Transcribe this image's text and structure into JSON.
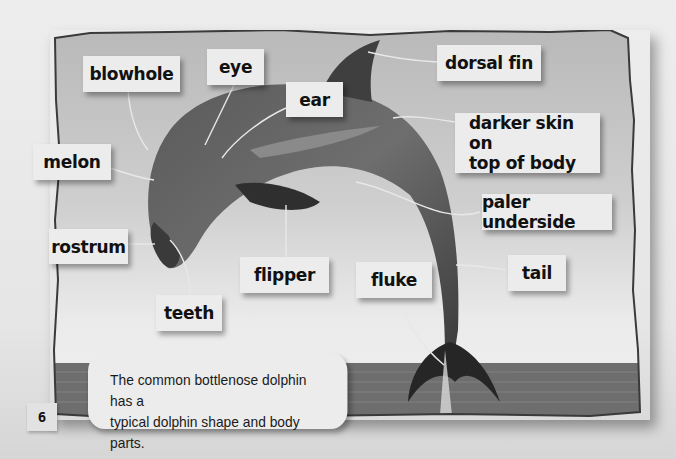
{
  "diagram": {
    "subject": "bottlenose dolphin",
    "labels": {
      "blowhole": "blowhole",
      "eye": "eye",
      "ear": "ear",
      "dorsal_fin": "dorsal fin",
      "darker_skin_line1": "darker skin on",
      "darker_skin_line2": "top of body",
      "melon": "melon",
      "paler_underside": "paler underside",
      "rostrum": "rostrum",
      "flipper": "flipper",
      "fluke": "fluke",
      "tail": "tail",
      "teeth": "teeth"
    }
  },
  "caption": {
    "line1": "The common bottlenose dolphin has a",
    "line2": "typical dolphin shape and body parts."
  },
  "page": {
    "number": "6"
  },
  "colors": {
    "page_bg": "#e8e8e8",
    "frame_bg": "#bdbdbd",
    "label_bg": "#ececec",
    "text": "#111111",
    "dolphin": "#4a4a4a",
    "sea": "#6e6e6e"
  }
}
